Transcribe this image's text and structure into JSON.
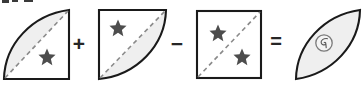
{
  "diagram": {
    "type": "geometry-equation",
    "canvas": {
      "width": 363,
      "height": 87
    },
    "colors": {
      "outline": "#1a1a1a",
      "fill_shaded": "#efefef",
      "fill_plain": "#ffffff",
      "dashed_diagonal": "#8a8a8a",
      "star": "#4d4d4d",
      "operator": "#262626",
      "background": "#ffffff"
    },
    "operators": [
      {
        "name": "plus",
        "symbol": "+"
      },
      {
        "name": "minus",
        "symbol": "−"
      },
      {
        "name": "equals",
        "symbol": "="
      }
    ],
    "terms": [
      {
        "index": 1,
        "name": "quarter-disc-upper-left",
        "shape": "quarter circle segment with arc bulging up-left, straight right and bottom edges",
        "shaded_region": "above diagonal",
        "diagonal": "dashed, bottom-left to top-right",
        "stars": 1,
        "star_positions": [
          "lower-right of diagonal"
        ],
        "inner_circle": false
      },
      {
        "index": 2,
        "name": "quarter-disc-lower-right",
        "shape": "quarter circle segment with arc bulging down-right, straight left and top edges",
        "shaded_region": "below diagonal",
        "diagonal": "dashed, bottom-left to top-right",
        "stars": 1,
        "star_positions": [
          "upper-left of diagonal"
        ],
        "inner_circle": false
      },
      {
        "index": 3,
        "name": "square",
        "shape": "square",
        "shaded_region": "none",
        "diagonal": "dashed, bottom-left to top-right",
        "stars": 2,
        "star_positions": [
          "upper-left of diagonal",
          "lower-right of diagonal"
        ],
        "inner_circle": false
      },
      {
        "index": 4,
        "name": "lens-vesica",
        "shape": "lens (vesica) formed by two arcs, tilted bottom-left to top-right",
        "shaded_region": "entire lens",
        "diagonal": "none",
        "stars": 0,
        "star_positions": [],
        "inner_circle": true,
        "inner_circle_glyph": "spiral-squiggle"
      }
    ]
  }
}
